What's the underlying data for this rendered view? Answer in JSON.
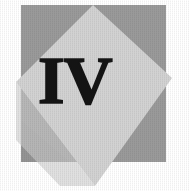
{
  "figure": {
    "name": "chapter-numeral-emblem",
    "numeral": "IV",
    "colors": {
      "background": "#ffffff",
      "square_gray": "#9a9a9a",
      "square_gray_shadow": "#8c8c8c",
      "diamond_light": "#d2d2d2",
      "diamond_light_edge": "#c6c6c6",
      "numeral_ink": "#141414"
    },
    "shapes": {
      "square": {
        "name": "gray-square",
        "x": 21,
        "y": 5,
        "width": 145,
        "height": 157,
        "fill": "#9a9a9a"
      },
      "diamond": {
        "name": "light-diamond",
        "points": "93,5 172,78 95,186 16,82",
        "fill": "#d2d2d2"
      }
    },
    "numeral_position": {
      "x": 40,
      "y": 55,
      "width": 58,
      "height": 55
    }
  }
}
